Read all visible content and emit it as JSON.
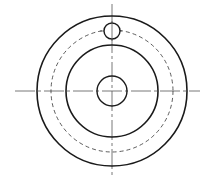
{
  "diagram": {
    "type": "engineering-drawing",
    "view": "front-view",
    "colors": {
      "background": "#ffffff",
      "stroke": "#1a1a1a",
      "centerline": "#555555"
    },
    "center": {
      "x": 112,
      "y": 91
    },
    "outer_circle": {
      "r": 75,
      "style": "solid",
      "stroke_width": 1.6
    },
    "pitch_circle": {
      "r": 61,
      "style": "dashed",
      "stroke_width": 0.8
    },
    "inner_circle": {
      "r": 46,
      "style": "solid",
      "stroke_width": 1.6
    },
    "center_hole": {
      "r": 15,
      "style": "solid",
      "stroke_width": 1.4
    },
    "offset_hole": {
      "cx": 112,
      "cy": 31,
      "r": 8,
      "style": "solid",
      "stroke_width": 1.4
    },
    "centerlines": {
      "horizontal": {
        "x1": 15,
        "x2": 200,
        "y": 91
      },
      "vertical": {
        "x": 112,
        "y1": 4,
        "y2": 178
      },
      "dasharray": "20 3 3 3"
    }
  }
}
